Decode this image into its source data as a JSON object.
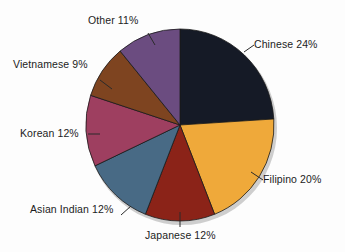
{
  "chart_data": {
    "type": "pie",
    "title": "",
    "subtitle": "",
    "xlabel": "",
    "ylabel": "",
    "legend_position": "none",
    "grid": false,
    "labels_outside": true,
    "start_angle_deg": 0,
    "direction": "clockwise",
    "categories": [
      "Chinese",
      "Filipino",
      "Japanese",
      "Asian Indian",
      "Korean",
      "Vietnamese",
      "Other"
    ],
    "values": [
      24,
      20,
      12,
      12,
      12,
      9,
      11
    ],
    "unit": "%",
    "slices": [
      {
        "name": "Chinese",
        "value": 24,
        "label": "Chinese 24%",
        "color": "#151a26",
        "start_deg": 0,
        "end_deg": 86.4
      },
      {
        "name": "Filipino",
        "value": 20,
        "label": "Filipino 20%",
        "color": "#efa93a",
        "start_deg": 86.4,
        "end_deg": 158.4
      },
      {
        "name": "Japanese",
        "value": 12,
        "label": "Japanese 12%",
        "color": "#8b2318",
        "start_deg": 158.4,
        "end_deg": 201.6
      },
      {
        "name": "Asian Indian",
        "value": 12,
        "label": "Asian Indian 12%",
        "color": "#486a85",
        "start_deg": 201.6,
        "end_deg": 244.8
      },
      {
        "name": "Korean",
        "value": 12,
        "label": "Korean 12%",
        "color": "#9e3f60",
        "start_deg": 244.8,
        "end_deg": 288.0
      },
      {
        "name": "Vietnamese",
        "value": 9,
        "label": "Vietnamese 9%",
        "color": "#7e4420",
        "start_deg": 288.0,
        "end_deg": 320.4
      },
      {
        "name": "Other",
        "value": 11,
        "label": "Other 11%",
        "color": "#6b4c80",
        "start_deg": 320.4,
        "end_deg": 360.0
      }
    ],
    "colors": {
      "background": "#fdfdfd",
      "text": "#1c1c1c",
      "leader_line": "#2a2a2a",
      "slice_edge": "#1a1a1a",
      "shadow": "#b9b9b9"
    }
  }
}
